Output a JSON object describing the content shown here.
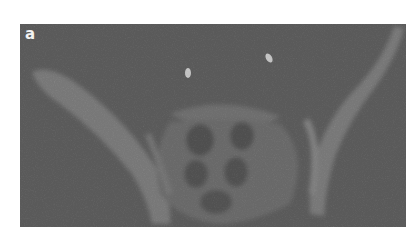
{
  "figure": {
    "panel_label": "a",
    "colors": {
      "background": "#5c5c5c",
      "bone": "#8a8a8a",
      "dark_region": "#4a4a4a",
      "bright_spot": "#e8e8e8",
      "label": "#f2f2f2"
    }
  }
}
